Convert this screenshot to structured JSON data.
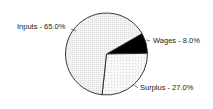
{
  "chart_data": {
    "type": "pie",
    "title": "",
    "categories": [
      "Inputs",
      "Wages",
      "Surplus"
    ],
    "values": [
      65.0,
      8.0,
      27.0
    ],
    "labels": [
      "Inputs - 65.0%",
      "Wages - 8.0%",
      "Surplus - 27.0%"
    ],
    "fills": [
      "#f2f2f2",
      "#000000",
      "#f7f7f7"
    ],
    "legend": "none (inline labels)",
    "start_angle_deg": -3,
    "direction": "clockwise"
  },
  "labels": {
    "inputs": "Inputs - 65.0%",
    "wages": "Wages - 8.0%",
    "surplus": "Surplus - 27.0%"
  }
}
